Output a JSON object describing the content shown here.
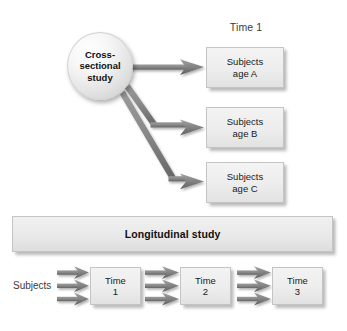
{
  "diagram": {
    "title_visible": false,
    "colors": {
      "box_fill_light": "#f3f3f3",
      "box_fill_dark": "#e2e2e2",
      "box_border": "#c4c4c4",
      "arrow_gray": "#7d7d7d",
      "arrow_gray_dark": "#6a6a6a",
      "text_dark": "#1a1a1a",
      "text_muted": "#3a3a3a",
      "page_background": "#ffffff"
    },
    "cross_sectional": {
      "node_label": "Cross-\nsectional\nstudy",
      "node_line_1": "Cross-",
      "node_line_2": "sectional",
      "node_line_3": "study",
      "time_header": "Time 1",
      "outcome_boxes": [
        {
          "line_1": "Subjects",
          "line_2": "age A"
        },
        {
          "line_1": "Subjects",
          "line_2": "age B"
        },
        {
          "line_1": "Subjects",
          "line_2": "age C"
        }
      ],
      "arrow_count": 3
    },
    "longitudinal": {
      "bar_label": "Longitudinal study",
      "subjects_label": "Subjects",
      "time_boxes": [
        {
          "line_1": "Time",
          "line_2": "1"
        },
        {
          "line_1": "Time",
          "line_2": "2"
        },
        {
          "line_1": "Time",
          "line_2": "3"
        }
      ],
      "arrow_groups": 3,
      "arrows_per_group": 3
    }
  }
}
